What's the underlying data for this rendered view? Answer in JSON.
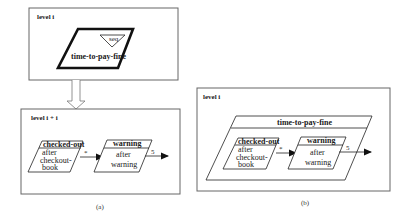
{
  "panel_a": {
    "top_frame": {
      "level_label": "level i",
      "superstate": {
        "name": "time-to-pay-fine",
        "badge": "seq"
      }
    },
    "bottom_frame": {
      "level_label": "level i + i",
      "states": [
        {
          "title": "checked-out",
          "body": [
            "after",
            "checkout-",
            "book"
          ]
        },
        {
          "title": "warning",
          "body": [
            "after",
            "warning"
          ]
        }
      ],
      "transitions": [
        {
          "label": "*"
        },
        {
          "label": "5"
        }
      ]
    },
    "caption": "(a)"
  },
  "panel_b": {
    "frame": {
      "level_label": "level i",
      "superstate": {
        "name": "time-to-pay-fine",
        "states": [
          {
            "title": "checked-out",
            "body": [
              "after",
              "checkout-",
              "book"
            ]
          },
          {
            "title": "warning",
            "body": [
              "after",
              "warning"
            ]
          }
        ],
        "transitions": [
          {
            "label": "*"
          },
          {
            "label": "5"
          }
        ]
      }
    },
    "caption": "(b)"
  },
  "colors": {
    "frame_stroke": "#666666",
    "shape_stroke": "#222222",
    "background": "#ffffff"
  }
}
